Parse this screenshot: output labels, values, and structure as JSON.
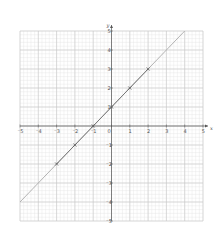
{
  "chart_data": {
    "type": "line",
    "title": "",
    "xlabel": "x",
    "ylabel": "y",
    "xlim": [
      -5,
      5
    ],
    "ylim": [
      -5,
      5
    ],
    "grid": true,
    "minor_subdivisions": 5,
    "x_ticks": [
      -5,
      -4,
      -3,
      -2,
      -1,
      0,
      1,
      2,
      3,
      4,
      5
    ],
    "y_ticks": [
      -5,
      -4,
      -3,
      -2,
      -1,
      1,
      2,
      3,
      4,
      5
    ],
    "origin_label": "0",
    "series": [
      {
        "name": "y = x + 1",
        "equation": "y = x + 1",
        "line_from": [
          -5,
          -4
        ],
        "line_to": [
          4,
          5
        ],
        "color": "#aaaaaa"
      },
      {
        "name": "plotted points",
        "marker": "x",
        "color": "#555555",
        "x": [
          -3,
          -2,
          -1,
          0,
          1,
          2
        ],
        "y": [
          -2,
          -1,
          0,
          1,
          2,
          3
        ]
      }
    ]
  },
  "colors": {
    "major_grid": "#c8c8c8",
    "minor_grid": "#e4e4e4",
    "axis": "#555555",
    "line": "#aaaaaa",
    "segment": "#666666"
  }
}
